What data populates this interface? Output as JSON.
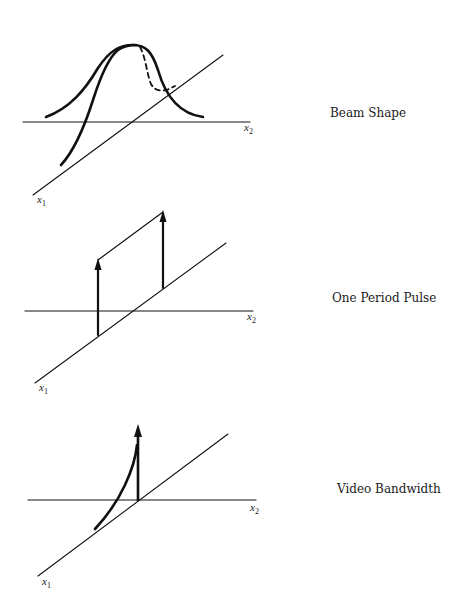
{
  "panels": [
    {
      "caption": "Beam Shape",
      "axis_x1": {
        "var": "x",
        "sub": "1"
      },
      "axis_x2": {
        "var": "x",
        "sub": "2"
      }
    },
    {
      "caption": "One Period Pulse",
      "axis_x1": {
        "var": "x",
        "sub": "1"
      },
      "axis_x2": {
        "var": "x",
        "sub": "2"
      }
    },
    {
      "caption": "Video Bandwidth",
      "axis_x1": {
        "var": "x",
        "sub": "1"
      },
      "axis_x2": {
        "var": "x",
        "sub": "2"
      }
    }
  ],
  "colors": {
    "ink": "#111111",
    "paper": "#ffffff"
  }
}
